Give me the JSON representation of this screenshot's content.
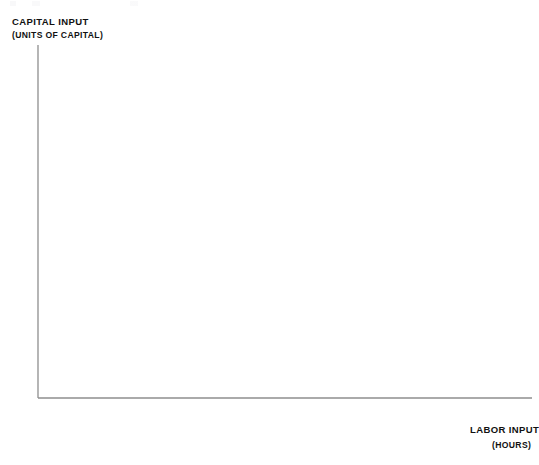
{
  "axes": {
    "y_title": "Capital input",
    "y_subtitle": "(units of capital)",
    "x_title": "Labor input",
    "x_subtitle": "(hours)",
    "x_ticks": [
      "0",
      "100",
      "200",
      "300",
      "400"
    ],
    "y_ticks": [
      "1",
      "2",
      "3",
      "4"
    ]
  },
  "colors": {
    "curve": "#C8893A",
    "axis": "#8e8e8e",
    "label_ring": "#8b8f9a",
    "label_text": "#2a3140",
    "background": "#ffffff"
  },
  "chart_data": {
    "type": "line",
    "title": "",
    "subtitle": "",
    "xlabel": "Labor input (hours)",
    "ylabel": "Capital input (units of capital)",
    "xlim": [
      0,
      480
    ],
    "ylim": [
      0,
      4.55
    ],
    "grid": false,
    "legend": "none",
    "note": "Isoquant map: each curve is a contour of equal output q; curves are hyperbolas of the form K = c(q)/L.",
    "series": [
      {
        "name": "1",
        "constant": 13,
        "label_points": [
          {
            "x": 13,
            "y": 1
          },
          {
            "x": 4.3,
            "y": 3
          },
          {
            "x": 6.5,
            "y": 2
          },
          {
            "x": 3.2,
            "y": 4
          }
        ]
      },
      {
        "name": "2",
        "constant": 22,
        "label_points": [
          {
            "x": 22,
            "y": 1
          },
          {
            "x": 7.3,
            "y": 3
          },
          {
            "x": 11,
            "y": 2
          },
          {
            "x": 5.5,
            "y": 4
          }
        ]
      },
      {
        "name": "3",
        "constant": 32,
        "label_points": [
          {
            "x": 32,
            "y": 1
          },
          {
            "x": 10.7,
            "y": 3
          },
          {
            "x": 16,
            "y": 2
          },
          {
            "x": 8,
            "y": 4
          }
        ]
      },
      {
        "name": "4",
        "constant": 43,
        "label_points": [
          {
            "x": 43,
            "y": 1
          },
          {
            "x": 14.3,
            "y": 3
          },
          {
            "x": 21.5,
            "y": 2
          },
          {
            "x": 10.8,
            "y": 4
          }
        ]
      },
      {
        "name": "5",
        "constant": 56,
        "label_points": [
          {
            "x": 56,
            "y": 1
          },
          {
            "x": 18.7,
            "y": 3
          },
          {
            "x": 28,
            "y": 2
          },
          {
            "x": 14,
            "y": 4
          }
        ]
      },
      {
        "name": "6",
        "constant": 71,
        "label_points": [
          {
            "x": 71,
            "y": 1
          },
          {
            "x": 23.7,
            "y": 3
          },
          {
            "x": 35.5,
            "y": 2
          },
          {
            "x": 17.8,
            "y": 4
          }
        ]
      },
      {
        "name": "7",
        "constant": 90,
        "label_points": [
          {
            "x": 90,
            "y": 1
          },
          {
            "x": 30,
            "y": 3
          },
          {
            "x": 45,
            "y": 2
          },
          {
            "x": 22.5,
            "y": 4
          }
        ]
      },
      {
        "name": "8",
        "constant": 113,
        "label_points": [
          {
            "x": 113,
            "y": 1
          },
          {
            "x": 37.7,
            "y": 3
          },
          {
            "x": 56.5,
            "y": 2
          },
          {
            "x": 28.3,
            "y": 4
          }
        ]
      },
      {
        "name": "9",
        "constant": 142,
        "label_points": [
          {
            "x": 142,
            "y": 1
          },
          {
            "x": 47.3,
            "y": 3
          },
          {
            "x": 71,
            "y": 2
          },
          {
            "x": 35.5,
            "y": 4
          }
        ]
      },
      {
        "name": "10",
        "constant": 180,
        "label_points": [
          {
            "x": 180,
            "y": 1
          },
          {
            "x": 60,
            "y": 3
          },
          {
            "x": 90,
            "y": 2
          },
          {
            "x": 45,
            "y": 4
          }
        ]
      },
      {
        "name": "11",
        "constant": 232,
        "label_points": [
          {
            "x": 232,
            "y": 1
          },
          {
            "x": 77.3,
            "y": 3
          },
          {
            "x": 116,
            "y": 2
          },
          {
            "x": 58,
            "y": 4
          }
        ]
      },
      {
        "name": "12",
        "constant": 300,
        "label_points": [
          {
            "x": 300,
            "y": 1
          },
          {
            "x": 100,
            "y": 3
          },
          {
            "x": 150,
            "y": 2
          },
          {
            "x": 75,
            "y": 4
          }
        ]
      },
      {
        "name": "13",
        "constant": 400,
        "label_points": [
          {
            "x": 400,
            "y": 1
          },
          {
            "x": 133,
            "y": 3
          },
          {
            "x": 200,
            "y": 2
          },
          {
            "x": 100,
            "y": 4
          }
        ]
      },
      {
        "name": "14",
        "constant": 540,
        "label_points": [
          {
            "x": 180,
            "y": 3
          },
          {
            "x": 270,
            "y": 2
          },
          {
            "x": 135,
            "y": 4
          }
        ]
      },
      {
        "name": "15",
        "constant": 720,
        "label_points": [
          {
            "x": 240,
            "y": 3
          },
          {
            "x": 180,
            "y": 4
          }
        ]
      },
      {
        "name": "16",
        "constant": 960,
        "label_points": [
          {
            "x": 240,
            "y": 4
          }
        ]
      }
    ],
    "unlabeled_curves": [
      {
        "constant": 9.5
      },
      {
        "constant": 6.5
      },
      {
        "constant": 4.4
      },
      {
        "constant": 2.6
      }
    ],
    "labels": [
      {
        "text": "1",
        "x": 13,
        "y": 1
      },
      {
        "text": "2",
        "x": 22,
        "y": 1
      },
      {
        "text": "3",
        "x": 32,
        "y": 1
      },
      {
        "text": "4",
        "x": 43,
        "y": 1
      },
      {
        "text": "5",
        "x": 56,
        "y": 1
      },
      {
        "text": "6",
        "x": 71,
        "y": 1
      },
      {
        "text": "7",
        "x": 90,
        "y": 1
      },
      {
        "text": "8",
        "x": 113,
        "y": 1
      },
      {
        "text": "9",
        "x": 142,
        "y": 1
      },
      {
        "text": "10",
        "x": 180,
        "y": 1
      },
      {
        "text": "11",
        "x": 232,
        "y": 1
      },
      {
        "text": "12",
        "x": 300,
        "y": 1
      },
      {
        "text": "13",
        "x": 400,
        "y": 1
      },
      {
        "text": "1",
        "x": 6.5,
        "y": 2
      },
      {
        "text": "2",
        "x": 11,
        "y": 2
      },
      {
        "text": "3",
        "x": 16,
        "y": 2
      },
      {
        "text": "4",
        "x": 21.5,
        "y": 2
      },
      {
        "text": "5",
        "x": 28,
        "y": 2
      },
      {
        "text": "6",
        "x": 35.5,
        "y": 2
      },
      {
        "text": "7",
        "x": 45,
        "y": 2
      },
      {
        "text": "8",
        "x": 56.5,
        "y": 2
      },
      {
        "text": "9",
        "x": 71,
        "y": 2
      },
      {
        "text": "10",
        "x": 90,
        "y": 2
      },
      {
        "text": "11",
        "x": 116,
        "y": 2
      },
      {
        "text": "12",
        "x": 150,
        "y": 2
      },
      {
        "text": "13",
        "x": 200,
        "y": 2
      },
      {
        "text": "14",
        "x": 270,
        "y": 2
      },
      {
        "text": "1",
        "x": 4.3,
        "y": 3
      },
      {
        "text": "2",
        "x": 7.3,
        "y": 3
      },
      {
        "text": "3",
        "x": 10.7,
        "y": 3
      },
      {
        "text": "4",
        "x": 14.3,
        "y": 3
      },
      {
        "text": "5",
        "x": 18.7,
        "y": 3
      },
      {
        "text": "6",
        "x": 23.7,
        "y": 3
      },
      {
        "text": "7",
        "x": 30,
        "y": 3
      },
      {
        "text": "8",
        "x": 37.7,
        "y": 3
      },
      {
        "text": "9",
        "x": 47.3,
        "y": 3
      },
      {
        "text": "10",
        "x": 60,
        "y": 3
      },
      {
        "text": "11",
        "x": 77.3,
        "y": 3
      },
      {
        "text": "12",
        "x": 100,
        "y": 3
      },
      {
        "text": "13",
        "x": 133,
        "y": 3
      },
      {
        "text": "14",
        "x": 180,
        "y": 3
      },
      {
        "text": "15",
        "x": 240,
        "y": 3
      },
      {
        "text": "1",
        "x": 3.2,
        "y": 4
      },
      {
        "text": "2",
        "x": 5.5,
        "y": 4
      },
      {
        "text": "3",
        "x": 8,
        "y": 4
      },
      {
        "text": "4",
        "x": 10.8,
        "y": 4
      },
      {
        "text": "5",
        "x": 14,
        "y": 4
      },
      {
        "text": "6",
        "x": 17.8,
        "y": 4
      },
      {
        "text": "7",
        "x": 22.5,
        "y": 4
      },
      {
        "text": "8",
        "x": 28.3,
        "y": 4
      },
      {
        "text": "9",
        "x": 35.5,
        "y": 4
      },
      {
        "text": "10",
        "x": 45,
        "y": 4
      },
      {
        "text": "11",
        "x": 58,
        "y": 4
      },
      {
        "text": "12",
        "x": 75,
        "y": 4
      },
      {
        "text": "13",
        "x": 100,
        "y": 4
      },
      {
        "text": "14",
        "x": 135,
        "y": 4
      },
      {
        "text": "15",
        "x": 180,
        "y": 4
      },
      {
        "text": "16",
        "x": 240,
        "y": 4
      }
    ]
  }
}
